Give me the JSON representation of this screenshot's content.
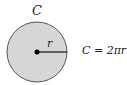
{
  "diagram": {
    "circle_label": "C",
    "radius_label": "r",
    "formula": "C = 2πr",
    "colors": {
      "fill": "#d6d6d6",
      "stroke": "#555555",
      "radius_line": "#111111",
      "center_dot": "#000000"
    }
  }
}
